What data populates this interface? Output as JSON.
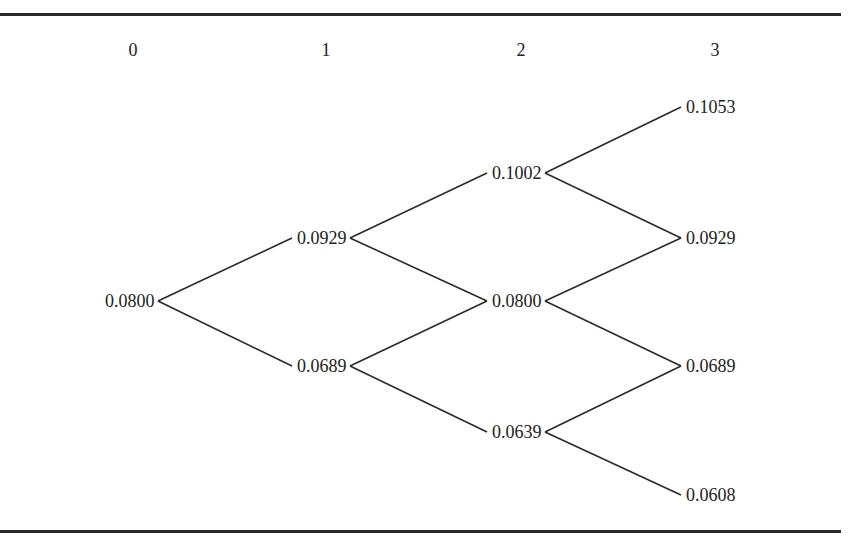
{
  "diagram": {
    "type": "binomial-interest-rate-tree",
    "step_headers": [
      "0",
      "1",
      "2",
      "3"
    ],
    "nodes": {
      "step0": [
        {
          "id": "n0_0",
          "label": "0.0800"
        }
      ],
      "step1": [
        {
          "id": "n1_0",
          "label": "0.0929"
        },
        {
          "id": "n1_1",
          "label": "0.0689"
        }
      ],
      "step2": [
        {
          "id": "n2_0",
          "label": "0.1002"
        },
        {
          "id": "n2_1",
          "label": "0.0800"
        },
        {
          "id": "n2_2",
          "label": "0.0639"
        }
      ],
      "step3": [
        {
          "id": "n3_0",
          "label": "0.1053"
        },
        {
          "id": "n3_1",
          "label": "0.0929"
        },
        {
          "id": "n3_2",
          "label": "0.0689"
        },
        {
          "id": "n3_3",
          "label": "0.0608"
        }
      ]
    },
    "edges": [
      [
        "n0_0",
        "n1_0"
      ],
      [
        "n0_0",
        "n1_1"
      ],
      [
        "n1_0",
        "n2_0"
      ],
      [
        "n1_0",
        "n2_1"
      ],
      [
        "n1_1",
        "n2_1"
      ],
      [
        "n1_1",
        "n2_2"
      ],
      [
        "n2_0",
        "n3_0"
      ],
      [
        "n2_0",
        "n3_1"
      ],
      [
        "n2_1",
        "n3_1"
      ],
      [
        "n2_1",
        "n3_2"
      ],
      [
        "n2_2",
        "n3_2"
      ],
      [
        "n2_2",
        "n3_3"
      ]
    ]
  }
}
